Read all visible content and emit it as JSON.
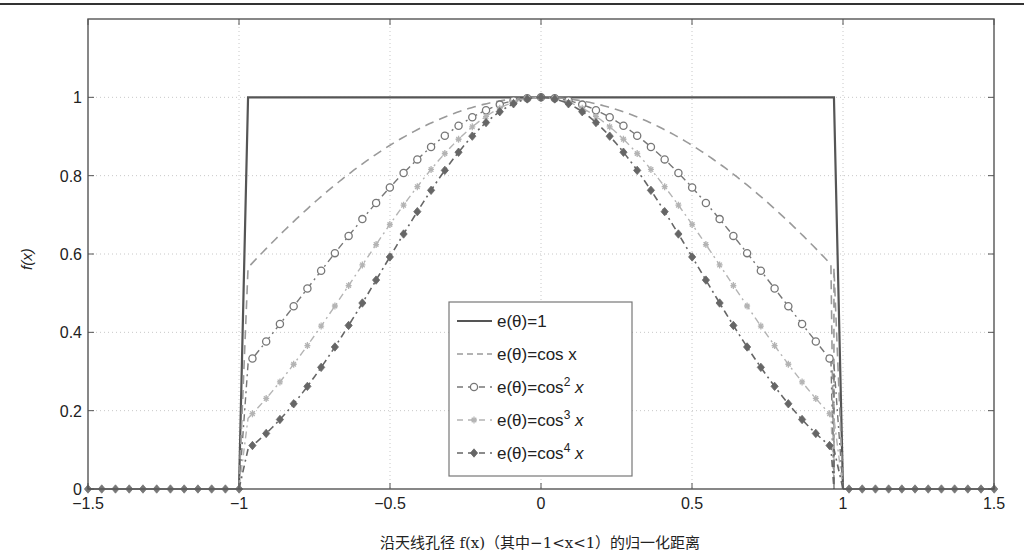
{
  "chart_data": {
    "type": "line",
    "title": "",
    "xlabel": "沿天线孔径 f(x)（其中−1<x<1）的归一化距离",
    "ylabel": "f(x)",
    "xlim": [
      -1.5,
      1.5
    ],
    "ylim": [
      0,
      1.2
    ],
    "grid": true,
    "legend_position": "inside-lower-center",
    "x_ticks": [
      -1.5,
      -1,
      -0.5,
      0,
      0.5,
      1,
      1.5
    ],
    "x_tick_labels": [
      "−1.5",
      "−1",
      "−0.5",
      "0",
      "0.5",
      "1",
      "1.5"
    ],
    "y_ticks": [
      0,
      0.2,
      0.4,
      0.6,
      0.8,
      1
    ],
    "y_tick_labels": [
      "0",
      "0.2",
      "0.4",
      "0.6",
      "0.8",
      "1"
    ],
    "aperture_half_width": 0.97,
    "series": [
      {
        "name": "e(θ)=1",
        "label_main": "e(θ)=1",
        "power": 0,
        "style": "solid",
        "marker": "none",
        "color": "#555555",
        "width": 2.2
      },
      {
        "name": "e(θ)=cos x",
        "label_main": "e(θ)=cos x",
        "power": 1,
        "style": "dashed",
        "marker": "none",
        "color": "#9a9a9a",
        "width": 1.6
      },
      {
        "name": "e(θ)=cos² x",
        "label_main": "e(θ)=cos",
        "label_sup": "2",
        "label_tail": " x",
        "power": 2,
        "style": "dashdot",
        "marker": "circle",
        "color": "#777777",
        "width": 1.4
      },
      {
        "name": "e(θ)=cos³ x",
        "label_main": "e(θ)=cos",
        "label_sup": "3",
        "label_tail": " x",
        "power": 3,
        "style": "dashdot",
        "marker": "star",
        "color": "#b4b4b4",
        "width": 1.4
      },
      {
        "name": "e(θ)=cos⁴ x",
        "label_main": "e(θ)=cos",
        "label_sup": "4",
        "label_tail": " x",
        "power": 4,
        "style": "dashdot",
        "marker": "diamond",
        "color": "#666666",
        "width": 1.6
      }
    ],
    "sample_points": {
      "x": [
        -0.97,
        -0.8,
        -0.6,
        -0.4,
        -0.2,
        0,
        0.2,
        0.4,
        0.6,
        0.8,
        0.97
      ],
      "cos_x": [
        0.565,
        0.697,
        0.825,
        0.921,
        0.98,
        1.0,
        0.98,
        0.921,
        0.825,
        0.697,
        0.565
      ],
      "cos2_x": [
        0.319,
        0.485,
        0.681,
        0.848,
        0.961,
        1.0,
        0.961,
        0.848,
        0.681,
        0.485,
        0.319
      ],
      "cos3_x": [
        0.18,
        0.338,
        0.562,
        0.781,
        0.941,
        1.0,
        0.941,
        0.781,
        0.562,
        0.338,
        0.18
      ],
      "cos4_x": [
        0.102,
        0.236,
        0.464,
        0.72,
        0.922,
        1.0,
        0.922,
        0.72,
        0.464,
        0.236,
        0.102
      ],
      "uniform": [
        1,
        1,
        1,
        1,
        1,
        1,
        1,
        1,
        1,
        1,
        1
      ]
    }
  }
}
